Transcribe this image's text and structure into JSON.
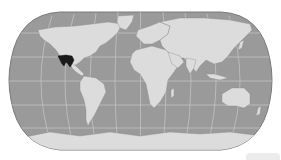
{
  "map": {
    "projection": "robinson-like",
    "highlighted_region": "Mexico",
    "colors": {
      "ocean": "#9a9a9a",
      "land": "#dcdcdc",
      "graticule": "#c8c8c8",
      "highlight": "#1a1a1a",
      "outline": "#7a7a7a",
      "background": "#ffffff"
    }
  }
}
